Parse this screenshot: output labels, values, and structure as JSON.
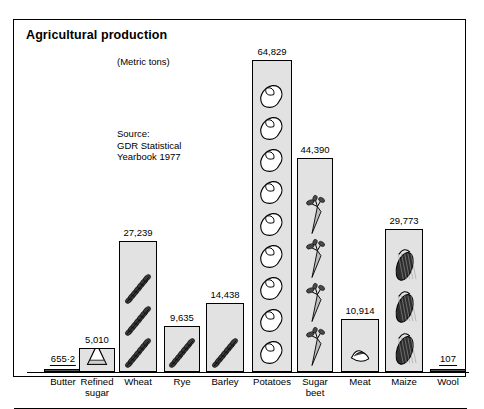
{
  "card": {
    "title": "Agricultural production",
    "units_note": "(Metric tons)",
    "source_note": "Source:\nGDR Statistical\nYearbook 1977"
  },
  "chart_data": {
    "type": "bar",
    "title": "Agricultural production",
    "subtitle": "(Metric tons)",
    "xlabel": "",
    "ylabel": "",
    "ylim": [
      0,
      64829
    ],
    "grid": false,
    "legend": "none",
    "note": "Pictorial bar chart; each bar filled with repeated commodity icons.",
    "categories": [
      "Butter",
      "Refined sugar",
      "Wheat",
      "Rye",
      "Barley",
      "Potatoes",
      "Sugar beet",
      "Meat",
      "Maize",
      "Wool"
    ],
    "values": [
      655.2,
      5010,
      27239,
      9635,
      14438,
      64829,
      44390,
      10914,
      29773,
      107
    ],
    "value_labels": [
      "655·2",
      "5,010",
      "27,239",
      "9,635",
      "14,438",
      "64,829",
      "44,390",
      "10,914",
      "29,773",
      "107"
    ],
    "icons": [
      "butter-icon",
      "sugar-cone-icon",
      "wheat-ear-icon",
      "rye-ear-icon",
      "barley-ear-icon",
      "potato-icon",
      "sugar-beet-icon",
      "meat-cut-icon",
      "maize-cob-icon",
      "wool-icon"
    ]
  },
  "bars": [
    {
      "label": "Butter",
      "label_lines": "Butter",
      "value_label": "655·2",
      "icon": "butter-icon"
    },
    {
      "label": "Refined sugar",
      "label_lines": "Refined\nsugar",
      "value_label": "5,010",
      "icon": "sugar-cone-icon"
    },
    {
      "label": "Wheat",
      "label_lines": "Wheat",
      "value_label": "27,239",
      "icon": "wheat-ear-icon"
    },
    {
      "label": "Rye",
      "label_lines": "Rye",
      "value_label": "9,635",
      "icon": "rye-ear-icon"
    },
    {
      "label": "Barley",
      "label_lines": "Barley",
      "value_label": "14,438",
      "icon": "barley-ear-icon"
    },
    {
      "label": "Potatoes",
      "label_lines": "Potatoes",
      "value_label": "64,829",
      "icon": "potato-icon"
    },
    {
      "label": "Sugar beet",
      "label_lines": "Sugar\nbeet",
      "value_label": "44,390",
      "icon": "sugar-beet-icon"
    },
    {
      "label": "Meat",
      "label_lines": "Meat",
      "value_label": "10,914",
      "icon": "meat-cut-icon"
    },
    {
      "label": "Maize",
      "label_lines": "Maize",
      "value_label": "29,773",
      "icon": "maize-cob-icon"
    },
    {
      "label": "Wool",
      "label_lines": "Wool",
      "value_label": "107",
      "icon": "wool-icon"
    }
  ],
  "colors": {
    "bar_fill": "#e2e2e2",
    "outline": "#000000",
    "background": "#ffffff"
  }
}
